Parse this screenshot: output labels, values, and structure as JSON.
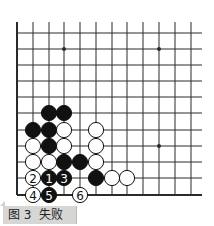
{
  "figure": {
    "caption_number": "图 3",
    "caption_title": "失败"
  },
  "board": {
    "description": "Lower-left corner of a Go board, left and bottom edges visible",
    "columns_x": [
      17,
      33,
      49,
      64,
      80,
      96,
      112,
      127,
      143,
      159,
      175,
      191
    ],
    "rows_y": [
      33,
      49,
      65,
      81,
      97,
      113,
      130,
      146,
      162,
      178,
      195
    ],
    "line_top": 22,
    "line_right": 202,
    "stone_radius": 7.6,
    "star_points": [
      [
        3,
        1
      ],
      [
        9,
        1
      ],
      [
        9,
        7
      ]
    ],
    "stones": [
      {
        "col": 2,
        "row": 5,
        "color": "black",
        "label": ""
      },
      {
        "col": 3,
        "row": 5,
        "color": "black",
        "label": ""
      },
      {
        "col": 1,
        "row": 6,
        "color": "black",
        "label": ""
      },
      {
        "col": 2,
        "row": 6,
        "color": "black",
        "label": ""
      },
      {
        "col": 3,
        "row": 6,
        "color": "white",
        "label": ""
      },
      {
        "col": 5,
        "row": 6,
        "color": "white",
        "label": ""
      },
      {
        "col": 1,
        "row": 7,
        "color": "white",
        "label": ""
      },
      {
        "col": 2,
        "row": 7,
        "color": "black",
        "label": ""
      },
      {
        "col": 3,
        "row": 7,
        "color": "white",
        "label": ""
      },
      {
        "col": 5,
        "row": 7,
        "color": "white",
        "label": ""
      },
      {
        "col": 1,
        "row": 8,
        "color": "white",
        "label": ""
      },
      {
        "col": 2,
        "row": 8,
        "color": "white",
        "label": ""
      },
      {
        "col": 3,
        "row": 8,
        "color": "black",
        "label": ""
      },
      {
        "col": 4,
        "row": 8,
        "color": "black",
        "label": ""
      },
      {
        "col": 5,
        "row": 8,
        "color": "white",
        "label": ""
      },
      {
        "col": 1,
        "row": 9,
        "color": "white",
        "label": "2"
      },
      {
        "col": 2,
        "row": 9,
        "color": "black",
        "label": "1"
      },
      {
        "col": 3,
        "row": 9,
        "color": "black",
        "label": "3"
      },
      {
        "col": 5,
        "row": 9,
        "color": "black",
        "label": ""
      },
      {
        "col": 6,
        "row": 9,
        "color": "white",
        "label": ""
      },
      {
        "col": 7,
        "row": 9,
        "color": "white",
        "label": ""
      },
      {
        "col": 1,
        "row": 10,
        "color": "white",
        "label": "4"
      },
      {
        "col": 2,
        "row": 10,
        "color": "black",
        "label": "5"
      },
      {
        "col": 4,
        "row": 10,
        "color": "white",
        "label": "6"
      }
    ],
    "colors": {
      "line": "#2a2a2a",
      "black_stone": "#111111",
      "white_stone": "#ffffff",
      "caption_bg": "#d6d6d4"
    }
  }
}
